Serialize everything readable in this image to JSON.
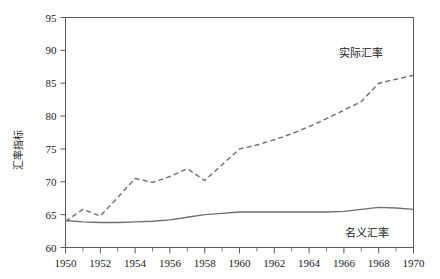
{
  "chart_data": {
    "type": "line",
    "title": "",
    "xlabel": "",
    "ylabel": "汇率指标",
    "xlim": [
      1950,
      1970
    ],
    "ylim": [
      60,
      95
    ],
    "yticks": [
      60,
      65,
      70,
      75,
      80,
      85,
      90,
      95
    ],
    "xticks": [
      1950,
      1952,
      1954,
      1956,
      1958,
      1960,
      1962,
      1964,
      1966,
      1968,
      1970
    ],
    "xticks_minor": [
      1951,
      1953,
      1955,
      1957,
      1959,
      1961,
      1963,
      1965,
      1967,
      1969
    ],
    "grid": false,
    "legend_position": "inline-annotation",
    "x": [
      1950,
      1951,
      1952,
      1953,
      1954,
      1955,
      1956,
      1957,
      1958,
      1959,
      1960,
      1961,
      1962,
      1963,
      1964,
      1965,
      1966,
      1967,
      1968,
      1969,
      1970
    ],
    "series": [
      {
        "name": "实际汇率",
        "style": "dashed",
        "label_x": 1967.0,
        "label_y": 89.0,
        "values": [
          64.0,
          65.8,
          64.8,
          67.6,
          70.5,
          69.9,
          70.8,
          72.0,
          70.2,
          72.6,
          75.0,
          75.6,
          76.4,
          77.3,
          78.4,
          79.6,
          80.9,
          82.2,
          85.0,
          85.6,
          86.2
        ]
      },
      {
        "name": "名义汇率",
        "style": "solid",
        "label_x": 1967.3,
        "label_y": 61.6,
        "values": [
          64.1,
          63.9,
          63.8,
          63.8,
          63.9,
          64.0,
          64.2,
          64.6,
          65.0,
          65.2,
          65.4,
          65.4,
          65.4,
          65.4,
          65.4,
          65.4,
          65.5,
          65.8,
          66.1,
          66.0,
          65.8
        ]
      }
    ]
  }
}
